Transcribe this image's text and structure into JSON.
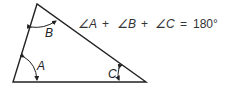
{
  "figure": {
    "type": "triangle-angle-sum",
    "stroke_color": "#222222",
    "angles": [
      {
        "name": "A",
        "label": "A"
      },
      {
        "name": "B",
        "label": "B"
      },
      {
        "name": "C",
        "label": "C"
      }
    ],
    "equation": {
      "term_a": "∠A",
      "plus1": "+",
      "term_b": "∠B",
      "plus2": "+",
      "term_c": "∠C",
      "equals": "=",
      "result": "180°"
    }
  }
}
